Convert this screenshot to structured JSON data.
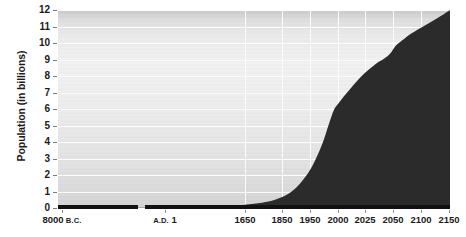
{
  "chart_data": {
    "type": "area",
    "title": "",
    "subtitle": "",
    "xlabel": "",
    "ylabel": "Population (in billions)",
    "ylim": [
      0,
      12
    ],
    "grid": true,
    "legend": null,
    "axis_break": {
      "present": true,
      "between": [
        "8000 B.C.",
        "A.D. 1"
      ],
      "note": "gap in x-axis line between the 8000 B.C. and A.D. 1 segments"
    },
    "y_ticks": [
      0,
      1,
      2,
      3,
      4,
      5,
      6,
      7,
      8,
      9,
      10,
      11,
      12
    ],
    "y_tick_labels": [
      "0",
      "1",
      "2",
      "3",
      "4",
      "5",
      "6",
      "7",
      "8",
      "9",
      "10",
      "11",
      "12"
    ],
    "x_tick_labels": [
      {
        "num": "8000",
        "era": "B.C."
      },
      {
        "num": "A.D.",
        "era": "1"
      },
      {
        "num": "1650",
        "era": ""
      },
      {
        "num": "1850",
        "era": ""
      },
      {
        "num": "1950",
        "era": ""
      },
      {
        "num": "2000",
        "era": ""
      },
      {
        "num": "2025",
        "era": ""
      },
      {
        "num": "2050",
        "era": ""
      },
      {
        "num": "2100",
        "era": ""
      },
      {
        "num": "2150",
        "era": ""
      }
    ],
    "x_categories": [
      "8000 B.C.",
      "A.D. 1",
      "1650",
      "1850",
      "1950",
      "2000",
      "2025",
      "2050",
      "2100",
      "2150"
    ],
    "values": [
      0.005,
      0.2,
      0.5,
      1.2,
      2.5,
      6.1,
      8.0,
      9.4,
      10.8,
      11.9
    ],
    "series": [
      {
        "name": "World population",
        "values": [
          0.005,
          0.2,
          0.5,
          1.2,
          2.5,
          6.1,
          8.0,
          9.4,
          10.8,
          11.9
        ]
      }
    ],
    "colors": {
      "area_fill": "#2b2b2b",
      "plot_background_light": "#f1f1f1",
      "plot_background_dark": "#c9c9c9",
      "gridline": "#fdfdfd",
      "axis": "#111111",
      "text": "#1b1b1b"
    }
  }
}
